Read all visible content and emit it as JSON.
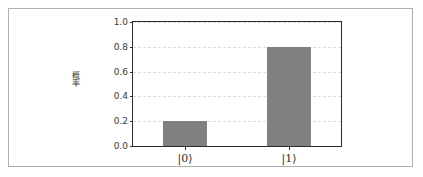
{
  "figure": {
    "background_color": "#ffffff",
    "frame_color": "#b0b0b0",
    "axes_border_color": "#2b2b2b",
    "grid_color": "#dddddd",
    "bar_color": "#808080"
  },
  "chart_data": {
    "type": "bar",
    "title": "",
    "xlabel": "",
    "ylabel": "概率",
    "categories": [
      "|0⟩",
      "|1⟩"
    ],
    "values": [
      0.2,
      0.8
    ],
    "ylim": [
      0.0,
      1.0
    ],
    "yticks": [
      "0.0",
      "0.2",
      "0.4",
      "0.6",
      "0.8",
      "1.0"
    ],
    "ytick_values": [
      0.0,
      0.2,
      0.4,
      0.6,
      0.8,
      1.0
    ],
    "grid": true,
    "grid_axis": "y",
    "grid_style": "dashed",
    "legend": null,
    "series": [
      {
        "name": "概率",
        "values": [
          0.2,
          0.8
        ],
        "color": "#808080"
      }
    ]
  }
}
